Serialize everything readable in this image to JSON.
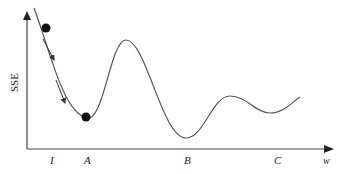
{
  "diagram": {
    "type": "error-surface-gradient-descent",
    "y_axis_label": "SSE",
    "x_axis_label": "w",
    "x_ticks": [
      {
        "label": "I",
        "x": 52
      },
      {
        "label": "A",
        "x": 88
      },
      {
        "label": "B",
        "x": 188
      },
      {
        "label": "C",
        "x": 278
      }
    ],
    "points": [
      {
        "name": "initial-point",
        "x": 46,
        "y": 28
      },
      {
        "name": "local-minimum-A",
        "x": 86,
        "y": 117
      }
    ],
    "curve_description": "SSE curve descending from initial weight I to local minimum A, rising to a peak, then dropping to global minimum B, rising to a smaller peak and shallow valley near C",
    "colors": {
      "curve": "#555555",
      "axes": "#444444",
      "points": "#111111",
      "arrows": "#333333"
    }
  }
}
